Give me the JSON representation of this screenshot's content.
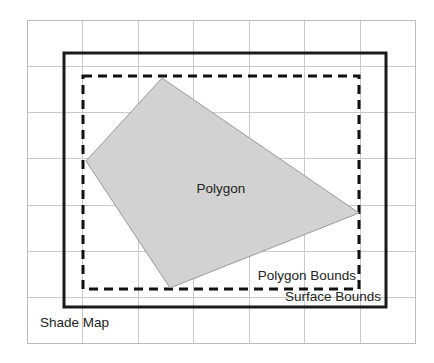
{
  "diagram": {
    "background_color": "#ffffff",
    "canvas": {
      "width": 434,
      "height": 363
    },
    "labels": {
      "shade_map": "Shade Map",
      "surface_bounds": "Surface Bounds",
      "polygon_bounds": "Polygon Bounds",
      "polygon": "Polygon"
    },
    "colors": {
      "grid": "#c9c9c9",
      "grid_border": "#bcbcbc",
      "surface_bounds_stroke": "#1a1a1a",
      "polygon_bounds_stroke": "#111111",
      "polygon_fill": "#d2d2d2",
      "polygon_stroke": "#9a9a9a",
      "text": "#232323"
    },
    "grid": {
      "x0": 27,
      "y0": 20,
      "x1": 415,
      "y1": 343,
      "columns": 7,
      "rows": 7,
      "cell_width": 55.4,
      "cell_height": 46.1,
      "vertical_lines": [
        27,
        82,
        138,
        193,
        249,
        304,
        360,
        415
      ],
      "horizontal_lines": [
        20,
        66,
        112,
        158,
        205,
        251,
        297,
        343
      ]
    },
    "surface_bounds": {
      "x": 64,
      "y": 53,
      "width": 322,
      "height": 254,
      "stroke_width": 3,
      "style": "solid"
    },
    "polygon_bounds": {
      "x": 83,
      "y": 76,
      "width": 276,
      "height": 213,
      "stroke_width": 3,
      "style": "dashed",
      "dash_pattern": "9 6"
    },
    "polygon": {
      "points": "162,78 359,213 170,288 86,161",
      "vertices": [
        {
          "x": 162,
          "y": 78
        },
        {
          "x": 359,
          "y": 213
        },
        {
          "x": 170,
          "y": 288
        },
        {
          "x": 86,
          "y": 161
        }
      ]
    },
    "label_positions": {
      "polygon": {
        "x": 221,
        "y": 193,
        "anchor": "middle"
      },
      "polygon_bounds": {
        "x": 356,
        "y": 280,
        "anchor": "end"
      },
      "surface_bounds": {
        "x": 381,
        "y": 301,
        "anchor": "end"
      },
      "shade_map": {
        "x": 40,
        "y": 327,
        "anchor": "start"
      }
    }
  }
}
